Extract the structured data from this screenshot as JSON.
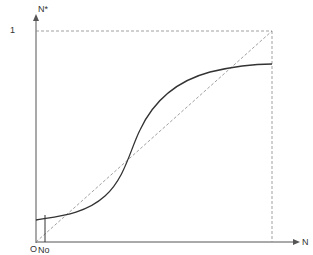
{
  "diagram": {
    "y_axis_label": "N*",
    "y_tick_label": "1",
    "x_axis_label": "N",
    "origin_label": "O",
    "x_marker_label": "No",
    "colors": {
      "axis": "#555555",
      "curve": "#333333",
      "dashed": "#888888",
      "text": "#333333"
    }
  }
}
